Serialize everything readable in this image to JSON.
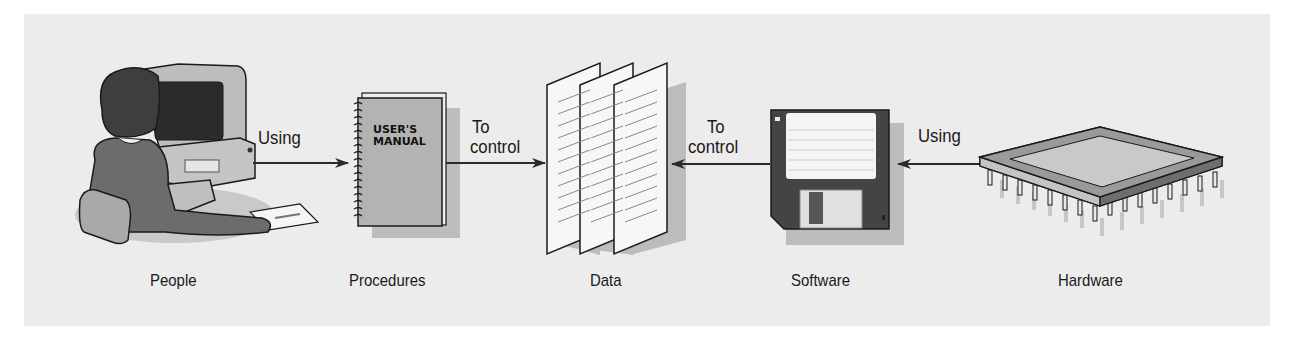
{
  "diagram": {
    "type": "flow",
    "components": [
      {
        "id": "people",
        "label": "People",
        "icon": "person-at-computer-icon"
      },
      {
        "id": "procedures",
        "label": "Procedures",
        "icon": "users-manual-icon",
        "icon_text_line1": "USER'S",
        "icon_text_line2": "MANUAL"
      },
      {
        "id": "data",
        "label": "Data",
        "icon": "documents-icon"
      },
      {
        "id": "software",
        "label": "Software",
        "icon": "floppy-disk-icon"
      },
      {
        "id": "hardware",
        "label": "Hardware",
        "icon": "microchip-icon"
      }
    ],
    "edges": [
      {
        "from": "people",
        "to": "procedures",
        "label": "Using"
      },
      {
        "from": "procedures",
        "to": "data",
        "label_line1": "To",
        "label_line2": "control"
      },
      {
        "from": "software",
        "to": "data",
        "label_line1": "To",
        "label_line2": "control"
      },
      {
        "from": "hardware",
        "to": "software",
        "label": "Using"
      }
    ]
  },
  "colors": {
    "background": "#ececec",
    "outline": "#1a1a1a",
    "shadow": "#b5b5b5"
  }
}
